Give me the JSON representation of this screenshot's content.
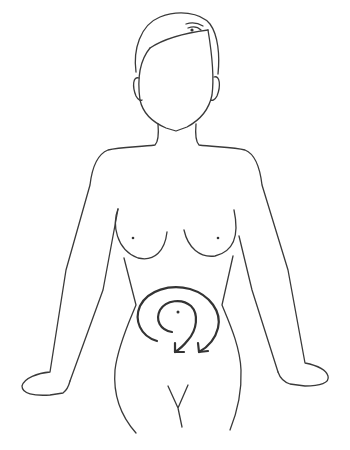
{
  "figure": {
    "annotation": "clockwise circular arrow on abdomen",
    "colors": {
      "background": "#ffffff",
      "line": "#3a3a3a",
      "arrow": "#333333"
    },
    "labels": []
  }
}
